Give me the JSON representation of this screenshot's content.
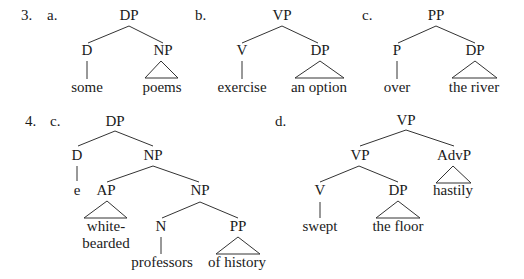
{
  "colors": {
    "text": "#1a1a1a",
    "line": "#333333",
    "background": "#ffffff"
  },
  "examples": [
    {
      "number": "3.",
      "subs": [
        {
          "label": "a.",
          "tree": {
            "root": "DP",
            "children": [
              {
                "label": "D",
                "terminal": "some",
                "branch": "line"
              },
              {
                "label": "NP",
                "terminal": "poems",
                "branch": "triangle"
              }
            ]
          }
        },
        {
          "label": "b.",
          "tree": {
            "root": "VP",
            "children": [
              {
                "label": "V",
                "terminal": "exercise",
                "branch": "line"
              },
              {
                "label": "DP",
                "terminal": "an option",
                "branch": "triangle"
              }
            ]
          }
        },
        {
          "label": "c.",
          "tree": {
            "root": "PP",
            "children": [
              {
                "label": "P",
                "terminal": "over",
                "branch": "line"
              },
              {
                "label": "DP",
                "terminal": "the river",
                "branch": "triangle"
              }
            ]
          }
        }
      ]
    },
    {
      "number": "4.",
      "subs": [
        {
          "label": "c.",
          "tree": {
            "root": "DP",
            "children": [
              {
                "label": "D",
                "terminal": "e",
                "branch": "line"
              },
              {
                "label": "NP",
                "children": [
                  {
                    "label": "AP",
                    "terminal_lines": [
                      "white-",
                      "bearded"
                    ],
                    "branch": "triangle"
                  },
                  {
                    "label": "NP",
                    "children": [
                      {
                        "label": "N",
                        "terminal": "professors",
                        "branch": "line"
                      },
                      {
                        "label": "PP",
                        "terminal": "of history",
                        "branch": "triangle"
                      }
                    ]
                  }
                ]
              }
            ]
          }
        },
        {
          "label": "d.",
          "tree": {
            "root": "VP",
            "children": [
              {
                "label": "VP",
                "children": [
                  {
                    "label": "V",
                    "terminal": "swept",
                    "branch": "line"
                  },
                  {
                    "label": "DP",
                    "terminal": "the floor",
                    "branch": "triangle"
                  }
                ]
              },
              {
                "label": "AdvP",
                "terminal": "hastily",
                "branch": "triangle"
              }
            ]
          }
        }
      ]
    }
  ]
}
